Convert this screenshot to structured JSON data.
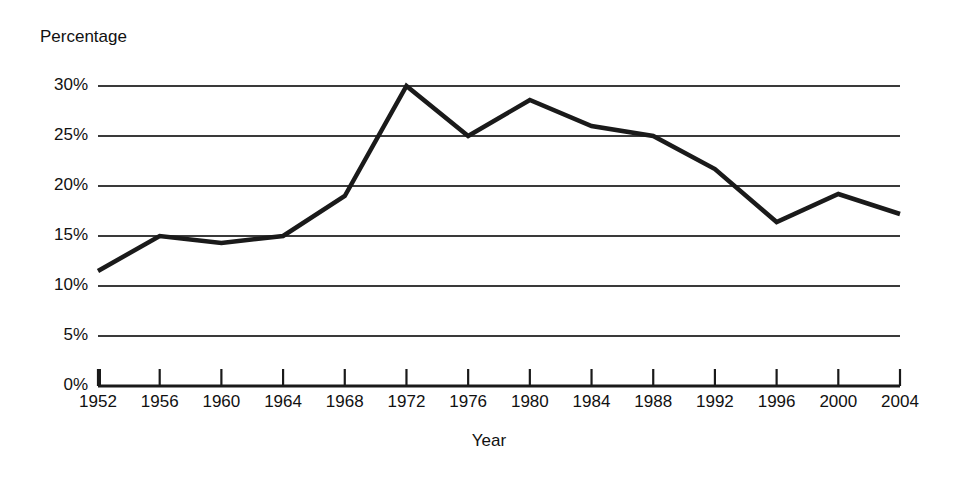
{
  "chart_data": {
    "type": "line",
    "title": "",
    "ylabel": "Percentage",
    "xlabel": "Year",
    "categories": [
      "1952",
      "1956",
      "1960",
      "1964",
      "1968",
      "1972",
      "1976",
      "1980",
      "1984",
      "1988",
      "1992",
      "1996",
      "2000",
      "2004"
    ],
    "values": [
      11.5,
      15.0,
      14.3,
      15.0,
      19.0,
      30.0,
      25.0,
      28.6,
      26.0,
      25.0,
      21.7,
      16.4,
      19.2,
      17.2
    ],
    "y_tick_labels": [
      "30%",
      "25%",
      "20%",
      "15%",
      "10%",
      "5%",
      "0%"
    ],
    "y_tick_values": [
      30,
      25,
      20,
      15,
      10,
      5,
      0
    ],
    "ylim": [
      0,
      30
    ],
    "grid": true,
    "legend": "none",
    "line_color": "#1a1a1a",
    "grid_color": "#3a3a3a",
    "axis_color": "#1a1a1a",
    "background_color": "#ffffff"
  }
}
